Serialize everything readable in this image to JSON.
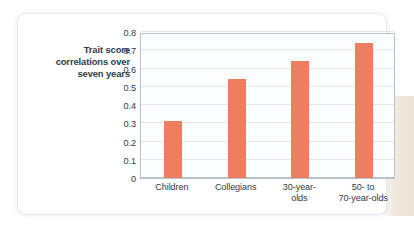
{
  "chart_data": {
    "type": "bar",
    "title": "",
    "xlabel": "",
    "ylabel": "Trait score correlations over seven years",
    "ylabel_lines": [
      "Trait score",
      "correlations over",
      "seven years"
    ],
    "categories": [
      "Children",
      "Collegians",
      "30-year-olds",
      "50- to 70-year-olds"
    ],
    "category_lines": [
      [
        "Children"
      ],
      [
        "Collegians"
      ],
      [
        "30-year-",
        "olds"
      ],
      [
        "50-  to",
        "70-year-olds"
      ]
    ],
    "values": [
      0.31,
      0.54,
      0.64,
      0.74
    ],
    "ylim": [
      0,
      0.8
    ],
    "yticks": [
      0.8,
      0.7,
      0.6,
      0.5,
      0.4,
      0.3,
      0.2,
      0.1,
      0
    ],
    "ytick_labels": [
      "0.8",
      "0.7",
      "0.6",
      "0.5",
      "0.4",
      "0.3",
      "0.2",
      "0.1",
      "0"
    ],
    "grid": true,
    "legend": "none",
    "bar_color": "#ED7F5E",
    "grid_color": "#dfe5ec",
    "axis_color": "#b9c2cc",
    "text_color": "#2f3b45",
    "plot_background": "#fcfdfe",
    "card_background": "#ffffff"
  }
}
